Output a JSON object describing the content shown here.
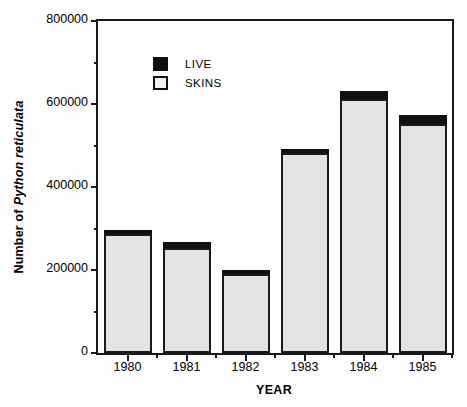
{
  "chart_data": {
    "type": "bar",
    "stacked": true,
    "title": "",
    "xlabel": "YEAR",
    "ylabel": "Number of Python reticulata",
    "ylabel_plain": "Number of",
    "ylabel_italic": "Python reticulata",
    "categories": [
      "1980",
      "1981",
      "1982",
      "1983",
      "1984",
      "1985"
    ],
    "series": [
      {
        "name": "SKINS",
        "color": "#e3e3e3",
        "values": [
          287000,
          253000,
          190000,
          482000,
          612000,
          552000
        ]
      },
      {
        "name": "LIVE",
        "color": "#101010",
        "values": [
          9000,
          14000,
          10000,
          9000,
          19000,
          21000
        ]
      }
    ],
    "totals": [
      296000,
      267000,
      200000,
      491000,
      631000,
      573000
    ],
    "ylim": [
      0,
      800000
    ],
    "ytick_labels": [
      "0",
      "200000",
      "400000",
      "600000",
      "800000"
    ],
    "ytick_values": [
      0,
      200000,
      400000,
      600000,
      800000
    ],
    "yminor_values": [
      100000,
      300000,
      500000,
      700000
    ],
    "grid": false,
    "legend_position": "upper-left-inside",
    "legend": [
      {
        "label": "LIVE",
        "color": "#101010"
      },
      {
        "label": "SKINS",
        "color": "#f2f2f2"
      }
    ]
  },
  "axis": {
    "x_title": "YEAR"
  }
}
